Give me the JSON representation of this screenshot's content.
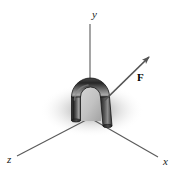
{
  "figure": {
    "background_color": "#ffffff",
    "axes": {
      "line_color": "#595959",
      "items": [
        {
          "name": "y",
          "label": "y",
          "label_x": 92,
          "label_y": 18,
          "x1": 90,
          "y1": 118,
          "x2": 90,
          "y2": 24
        },
        {
          "name": "x",
          "label": "x",
          "label_x": 163,
          "label_y": 165,
          "x1": 90,
          "y1": 118,
          "x2": 158,
          "y2": 157
        },
        {
          "name": "z",
          "label": "z",
          "label_x": 7,
          "label_y": 163,
          "x1": 90,
          "y1": 118,
          "x2": 17,
          "y2": 156
        }
      ]
    },
    "vector": {
      "name": "F",
      "label": "F",
      "label_x": 138,
      "label_y": 80,
      "color": "#545454",
      "x1": 104,
      "y1": 101,
      "x2": 151,
      "y2": 55
    },
    "object": {
      "name": "bent-tube",
      "description": "dark gray U-shaped bent tube standing on the origin",
      "fill_dark": "#2b2b2b",
      "fill_mid": "#6b6b6b",
      "fill_light": "#b9b9b9",
      "outline": "#141414"
    },
    "shadow": {
      "name": "ground-shadow",
      "color": "#9a9a9a",
      "cx": 92,
      "cy": 110,
      "rx": 52,
      "ry": 26
    }
  }
}
